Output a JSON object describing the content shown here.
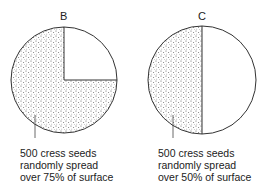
{
  "diagrams": [
    {
      "id": "B",
      "title": "B",
      "caption": [
        "500 cress seeds",
        "randomly spread",
        "over 75% of surface"
      ],
      "coverage_percent": 75,
      "seed_count": 500
    },
    {
      "id": "C",
      "title": "C",
      "caption": [
        "500 cress seeds",
        "randomly spread",
        "over 50% of surface"
      ],
      "coverage_percent": 50,
      "seed_count": 500
    }
  ],
  "colors": {
    "stroke": "#333333",
    "dots": "#555555",
    "background": "#ffffff"
  }
}
